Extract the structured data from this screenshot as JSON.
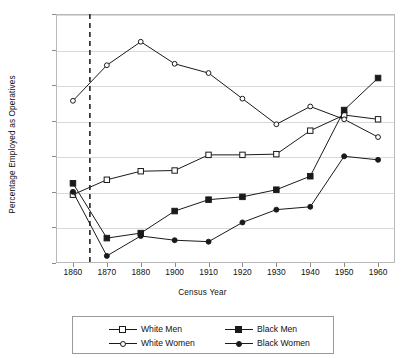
{
  "chart_data": {
    "type": "line",
    "title": "",
    "xlabel": "Census Year",
    "ylabel": "Percentage Employed as Operatives",
    "categories": [
      "1860",
      "1870",
      "1880",
      "1900",
      "1910",
      "1920",
      "1930",
      "1940",
      "1950",
      "1960"
    ],
    "ylim": [
      0,
      35
    ],
    "yticks": [
      0,
      5,
      10,
      15,
      20,
      25,
      30,
      35
    ],
    "grid": true,
    "legend_position": "bottom",
    "annotations": [
      {
        "type": "vline",
        "label": "1865",
        "style": "dashed",
        "x_between": [
          "1860",
          "1870"
        ],
        "x_fraction": 0.5
      }
    ],
    "series": [
      {
        "name": "White Men",
        "marker": "open-square",
        "values": [
          9.6,
          11.7,
          12.9,
          13.0,
          15.2,
          15.2,
          15.3,
          18.6,
          20.8,
          20.2
        ]
      },
      {
        "name": "Black Men",
        "marker": "filled-square",
        "values": [
          11.2,
          3.5,
          4.2,
          7.3,
          8.9,
          9.3,
          10.3,
          12.2,
          21.5,
          26.0
        ]
      },
      {
        "name": "White Women",
        "marker": "open-circle",
        "values": [
          22.8,
          27.8,
          31.1,
          28.0,
          26.7,
          23.1,
          19.5,
          22.0,
          20.2,
          17.7
        ]
      },
      {
        "name": "Black Women",
        "marker": "filled-circle",
        "values": [
          10.0,
          1.0,
          3.8,
          3.2,
          3.0,
          5.7,
          7.5,
          7.9,
          15.0,
          14.5
        ]
      }
    ]
  },
  "legend": {
    "entries": [
      {
        "label": "White Men"
      },
      {
        "label": "Black Men"
      },
      {
        "label": "White Women"
      },
      {
        "label": "Black Women"
      }
    ]
  },
  "colors": {
    "line": "#1a1a1a",
    "grid": "#d9d9d9",
    "frame": "#b9b9b9",
    "text": "#111111",
    "marker_fill_open": "#ffffff"
  }
}
